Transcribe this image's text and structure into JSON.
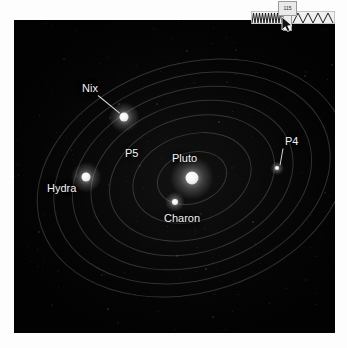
{
  "widget": {
    "name": "waveform-slider",
    "tooltip_label": "115",
    "cursor": "mouse-arrow-cursor",
    "dense_segment": "dense-sawtooth",
    "sparse_segment": "wide-zigzag"
  },
  "image": {
    "alt": "Pluto system with moons and orbital paths",
    "background_color": "#050505",
    "label_color": "#f2f2f2",
    "orbit_color": "rgba(150,152,160,0.30)",
    "labels": [
      {
        "text": "Nix",
        "x": 68,
        "y": 63,
        "leader": true
      },
      {
        "text": "P5",
        "x": 111,
        "y": 128,
        "leader": false
      },
      {
        "text": "Pluto",
        "x": 158,
        "y": 133,
        "leader": false
      },
      {
        "text": "P4",
        "x": 271,
        "y": 116,
        "leader": true
      },
      {
        "text": "Hydra",
        "x": 33,
        "y": 163,
        "leader": false
      },
      {
        "text": "Charon",
        "x": 150,
        "y": 193,
        "leader": false
      }
    ],
    "bodies": [
      {
        "name": "pluto",
        "x": 178,
        "y": 158,
        "size": 13
      },
      {
        "name": "charon",
        "x": 161,
        "y": 182,
        "size": 6
      },
      {
        "name": "nix",
        "x": 110,
        "y": 97,
        "size": 9
      },
      {
        "name": "hydra",
        "x": 72,
        "y": 157,
        "size": 9
      },
      {
        "name": "p4",
        "x": 263,
        "y": 148,
        "size": 4
      }
    ],
    "orbits": [
      {
        "w": 72,
        "h": 52
      },
      {
        "w": 122,
        "h": 88
      },
      {
        "w": 170,
        "h": 122
      },
      {
        "w": 208,
        "h": 150
      },
      {
        "w": 246,
        "h": 177
      },
      {
        "w": 284,
        "h": 204
      },
      {
        "w": 318,
        "h": 229
      }
    ]
  }
}
